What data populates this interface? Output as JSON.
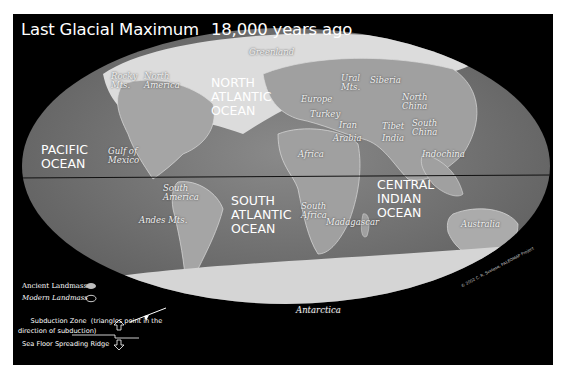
{
  "page": {
    "top_caption_partial": "INTRODUCING OCEANOGRAPHY"
  },
  "map": {
    "title": "Last Glacial Maximum",
    "subtitle": "18,000 years ago",
    "projection": "Mollweide (elliptical world map)",
    "colors": {
      "frame": "#000000",
      "ocean": "#7a7a7a",
      "land": "#a8a8a8",
      "ice": "#e6e6e6",
      "equator_line": "#111111",
      "label_text": "#ffffff"
    },
    "ocean_labels": [
      {
        "name": "PACIFIC\nOCEAN"
      },
      {
        "name": "NORTH\nATLANTIC\nOCEAN"
      },
      {
        "name": "SOUTH\nATLANTIC\nOCEAN"
      },
      {
        "name": "CENTRAL\nINDIAN\nOCEAN"
      }
    ],
    "place_labels": [
      {
        "name": "Greenland"
      },
      {
        "name": "Rocky\nMts."
      },
      {
        "name": "North\nAmerica"
      },
      {
        "name": "Gulf of\nMexico"
      },
      {
        "name": "Europe"
      },
      {
        "name": "Ural\nMts."
      },
      {
        "name": "Siberia"
      },
      {
        "name": "Turkey"
      },
      {
        "name": "Iran"
      },
      {
        "name": "Arabia"
      },
      {
        "name": "Tibet"
      },
      {
        "name": "India"
      },
      {
        "name": "North\nChina"
      },
      {
        "name": "South\nChina"
      },
      {
        "name": "Indochina"
      },
      {
        "name": "Africa"
      },
      {
        "name": "South\nAmerica"
      },
      {
        "name": "Andes Mts."
      },
      {
        "name": "South\nAfrica"
      },
      {
        "name": "Madagascar"
      },
      {
        "name": "Australia"
      },
      {
        "name": "Antarctica"
      }
    ],
    "credit": "© 2002 C. R. Scotese, PALEOMAP Project"
  },
  "legend": {
    "items": [
      {
        "label": "Ancient Landmass",
        "icon": "filled-blob-icon"
      },
      {
        "label": "Modern Landmass",
        "icon": "outline-blob-icon"
      },
      {
        "label": "Subduction Zone  (triangles point in the\ndirection of subduction)",
        "icon": "subduction-line-icon"
      },
      {
        "label": "Sea Floor Spreading Ridge",
        "icon": "ridge-line-icon"
      }
    ]
  }
}
